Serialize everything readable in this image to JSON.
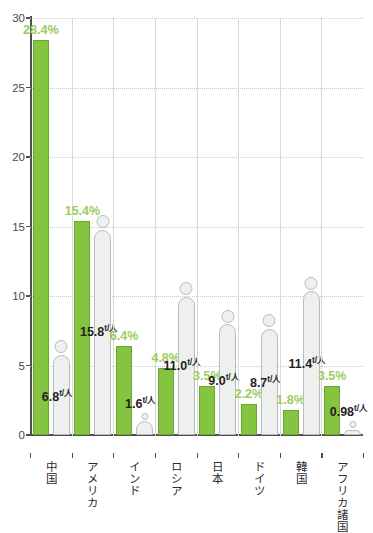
{
  "chart_data": {
    "type": "bar",
    "title": "",
    "subtitle": "",
    "xlabel": "",
    "ylabel": "",
    "ylim": [
      0,
      30
    ],
    "yticks": [
      0,
      5,
      10,
      15,
      20,
      25,
      30
    ],
    "ytick_labels": [
      "0",
      "5",
      "10",
      "15",
      "20",
      "25",
      "30"
    ],
    "grid": true,
    "legend_position": "none",
    "categories": [
      "中国",
      "アメリカ",
      "インド",
      "ロシア",
      "日本",
      "ドイツ",
      "韓国",
      "アフリカ諸国"
    ],
    "series": [
      {
        "name": "share_percent",
        "unit": "%",
        "color": "#85c440",
        "label_color": "#9ccb60",
        "values": [
          28.4,
          15.4,
          6.4,
          4.8,
          3.5,
          2.2,
          1.8,
          3.5
        ],
        "labels": [
          "28.4%",
          "15.4%",
          "6.4%",
          "4.8%",
          "3.5%",
          "2.2%",
          "1.8%",
          "3.5%"
        ]
      },
      {
        "name": "per_capita",
        "unit": "t/人",
        "color": "#eef0ef",
        "label_color": "#1f1f1f",
        "values": [
          6.8,
          15.8,
          1.6,
          11.0,
          9.0,
          8.7,
          11.4,
          0.98
        ],
        "labels": [
          "6.8",
          "15.8",
          "1.6",
          "11.0",
          "9.0",
          "8.7",
          "11.4",
          "0.98"
        ],
        "unit_labels": [
          "t/人",
          "t/人",
          "t/人",
          "t/人",
          "t/人",
          "t/人",
          "t/人",
          "t/人"
        ]
      }
    ],
    "colors": {
      "bar_green": "#85c440",
      "bar_green_border": "#6aa72f",
      "person_fill": "#eef0ef",
      "person_border": "#b9bcbb",
      "axis": "#4d4d4d",
      "grid": "#c9c9c9",
      "separator": "#d8d8d8",
      "pct_text": "#9ccb60",
      "ton_text": "#1f1f1f",
      "tick_text": "#4a4a4a"
    }
  }
}
